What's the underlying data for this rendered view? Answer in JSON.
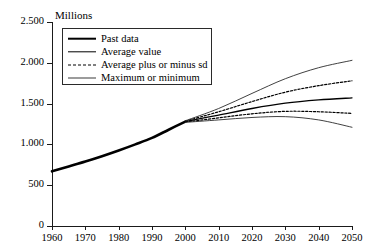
{
  "chart_data": {
    "type": "line",
    "title": "",
    "ylabel": "Millions",
    "xlabel": "",
    "ylim": [
      0,
      2500
    ],
    "xlim": [
      1960,
      2050
    ],
    "grid": false,
    "legend_position": "top-left-inside",
    "y_ticks": [
      0,
      500,
      1000,
      1500,
      2000,
      2500
    ],
    "y_tick_labels": [
      "0",
      "500",
      "1.000",
      "1.500",
      "2.000",
      "2.500"
    ],
    "x_ticks": [
      1960,
      1970,
      1980,
      1990,
      2000,
      2010,
      2020,
      2030,
      2040,
      2050
    ],
    "x_tick_labels": [
      "1960",
      "1970",
      "1980",
      "1990",
      "2000",
      "2010",
      "2020",
      "2030",
      "2040",
      "2050"
    ],
    "series": [
      {
        "name": "Past data",
        "style": "thick-solid",
        "x": [
          1960,
          1965,
          1970,
          1975,
          1980,
          1985,
          1990,
          1995,
          2000
        ],
        "values": [
          670,
          730,
          790,
          855,
          925,
          1000,
          1080,
          1180,
          1280
        ]
      },
      {
        "name": "Average value",
        "style": "medium-solid",
        "x": [
          2000,
          2010,
          2020,
          2030,
          2040,
          2050
        ],
        "values": [
          1280,
          1360,
          1440,
          1505,
          1545,
          1570
        ]
      },
      {
        "name": "Average plus sd",
        "style": "dashed",
        "x": [
          2000,
          2010,
          2020,
          2030,
          2040,
          2050
        ],
        "values": [
          1285,
          1400,
          1525,
          1640,
          1720,
          1780
        ]
      },
      {
        "name": "Average minus sd",
        "style": "dashed",
        "x": [
          2000,
          2010,
          2020,
          2030,
          2040,
          2050
        ],
        "values": [
          1275,
          1325,
          1375,
          1405,
          1400,
          1380
        ]
      },
      {
        "name": "Maximum",
        "style": "thin-solid",
        "x": [
          2000,
          2010,
          2020,
          2030,
          2040,
          2050
        ],
        "values": [
          1290,
          1440,
          1625,
          1805,
          1940,
          2030
        ]
      },
      {
        "name": "Minimum",
        "style": "thin-solid",
        "x": [
          2000,
          2010,
          2020,
          2030,
          2040,
          2050
        ],
        "values": [
          1270,
          1300,
          1330,
          1340,
          1300,
          1210
        ]
      }
    ]
  },
  "legend": {
    "items": [
      {
        "label": "Past data",
        "key": "thick-solid-key"
      },
      {
        "label": "Average value",
        "key": "medium-solid-key"
      },
      {
        "label": "Average plus or minus sd",
        "key": "dashed-key"
      },
      {
        "label": "Maximum or minimum",
        "key": "thin-solid-key"
      }
    ]
  }
}
